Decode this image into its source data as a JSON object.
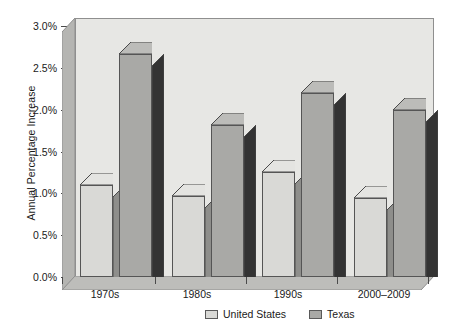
{
  "chart_data": {
    "type": "bar",
    "title": "",
    "xlabel": "",
    "ylabel": "Annual Percentage Increase",
    "categories": [
      "1970s",
      "1980s",
      "1990s",
      "2000–2009"
    ],
    "series": [
      {
        "name": "United States",
        "values": [
          1.1,
          0.97,
          1.25,
          0.95
        ],
        "color": "#d9d9d6"
      },
      {
        "name": "Texas",
        "values": [
          2.67,
          1.82,
          2.2,
          2.0
        ],
        "color": "#a9a9a6"
      }
    ],
    "ylim": [
      0.0,
      3.0
    ],
    "ytick_values": [
      0.0,
      0.5,
      1.0,
      1.5,
      2.0,
      2.5,
      3.0
    ],
    "ytick_labels": [
      "0.0%",
      "0.5%",
      "1.0%",
      "1.5%",
      "2.0%",
      "2.5%",
      "3.0%"
    ],
    "grid": false,
    "legend_position": "bottom-center",
    "style": "3d-column"
  },
  "legend": {
    "items": [
      {
        "label": "United States",
        "swatch": "us"
      },
      {
        "label": "Texas",
        "swatch": "tx"
      }
    ]
  },
  "colors": {
    "us_bar": "#d9d9d6",
    "tx_bar": "#a9a9a6",
    "bar_side_dark": "#333333",
    "bar_side_mid": "#8e8e8b",
    "plot_background": "#e7e7e4",
    "wall_shade": "#b5b5b2",
    "axis_line": "#4a4a4a",
    "text": "#1a1a1a"
  }
}
